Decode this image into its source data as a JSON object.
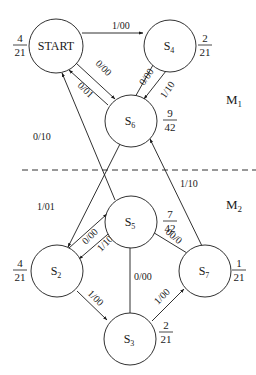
{
  "diagram": {
    "type": "state-machine",
    "regions": [
      {
        "id": "M1",
        "label": "M",
        "sub": "1"
      },
      {
        "id": "M2",
        "label": "M",
        "sub": "2"
      }
    ],
    "states": [
      {
        "id": "START",
        "label": "START",
        "sub": "",
        "prob_num": "4",
        "prob_den": "21",
        "region": "M1"
      },
      {
        "id": "S4",
        "label": "S",
        "sub": "4",
        "prob_num": "2",
        "prob_den": "21",
        "region": "M1"
      },
      {
        "id": "S6",
        "label": "S",
        "sub": "6",
        "prob_num": "9",
        "prob_den": "42",
        "region": "M1"
      },
      {
        "id": "S5",
        "label": "S",
        "sub": "5",
        "prob_num": "7",
        "prob_den": "42",
        "region": "M2"
      },
      {
        "id": "S2",
        "label": "S",
        "sub": "2",
        "prob_num": "4",
        "prob_den": "21",
        "region": "M2"
      },
      {
        "id": "S7",
        "label": "S",
        "sub": "7",
        "prob_num": "1",
        "prob_den": "21",
        "region": "M2"
      },
      {
        "id": "S3",
        "label": "S",
        "sub": "3",
        "prob_num": "2",
        "prob_den": "21",
        "region": "M2"
      }
    ],
    "transitions": [
      {
        "from": "START",
        "to": "S4",
        "label": "1/00"
      },
      {
        "from": "START",
        "to": "S6",
        "label": "0/00"
      },
      {
        "from": "S6",
        "to": "START",
        "label": "0/01"
      },
      {
        "from": "S4",
        "to": "S6",
        "label": "0/00"
      },
      {
        "from": "S4",
        "to": "S6",
        "label": "1/10"
      },
      {
        "from": "S5",
        "to": "START",
        "label": "0/10"
      },
      {
        "from": "S6",
        "to": "S2",
        "label": "1/01"
      },
      {
        "from": "S7",
        "to": "S6",
        "label": "1/10"
      },
      {
        "from": "S2",
        "to": "S5",
        "label": "0/00"
      },
      {
        "from": "S5",
        "to": "S2",
        "label": "1/10"
      },
      {
        "from": "S7",
        "to": "S5",
        "label": "00/0"
      },
      {
        "from": "S3",
        "to": "S5",
        "label": "0/00"
      },
      {
        "from": "S2",
        "to": "S3",
        "label": "1/00"
      },
      {
        "from": "S3",
        "to": "S7",
        "label": "1/00"
      }
    ]
  }
}
